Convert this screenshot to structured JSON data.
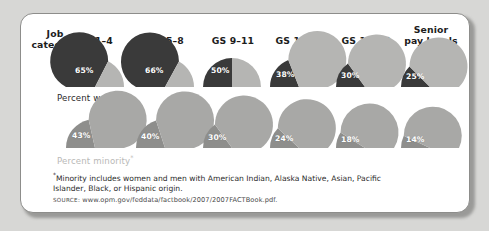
{
  "figure": {
    "row_label_header": "Job\ncategory",
    "women_caption": "Percent women",
    "minority_caption": "Percent minority",
    "minority_caption_marker": "*",
    "footnote_marker": "*",
    "footnote": "Minority includes women and men with American Indian, Alaska Native, Asian, Pacific Islander, Black, or Hispanic origin.",
    "source_label": "SOURCE:",
    "source_url": "www.opm.gov/feddata/factbook/2007/2007FACTBook.pdf."
  },
  "colors": {
    "page_background": "#d7d7d5",
    "card_background": "#ffffff",
    "card_border": "#8d8d8b",
    "women_value_fill": "#3a3a3a",
    "women_remainder_fill": "#b5b5b3",
    "minority_value_fill": "#8e8e8c",
    "minority_remainder_fill": "#a8a8a6",
    "value_label_text": "#ffffff",
    "header_text": "#1c1c1c",
    "women_caption_text": "#2a2a2a",
    "minority_caption_text": "#b9b9b7",
    "footnote_text": "#2b2b2b",
    "source_text": "#4a4a4a"
  },
  "chart_data": {
    "type": "pie",
    "title": "",
    "xlabel": "",
    "ylabel": "",
    "shape": "half-circle gauges, value arc drawn from left along 180-degree semicircle",
    "categories": [
      "GS 1–4",
      "GS 5–8",
      "GS 9–11",
      "GS 12–13",
      "GS 14–15",
      "Senior\npay levels"
    ],
    "series": [
      {
        "name": "Percent women",
        "unit": "%",
        "values": [
          65,
          66,
          50,
          38,
          30,
          25
        ],
        "labels": [
          "65%",
          "66%",
          "50%",
          "38%",
          "30%",
          "25%"
        ]
      },
      {
        "name": "Percent minority",
        "unit": "%",
        "values": [
          43,
          40,
          30,
          24,
          18,
          14
        ],
        "labels": [
          "43%",
          "40%",
          "30%",
          "24%",
          "18%",
          "14%"
        ]
      }
    ],
    "ylim": [
      0,
      100
    ],
    "grid": false,
    "legend": "none"
  }
}
